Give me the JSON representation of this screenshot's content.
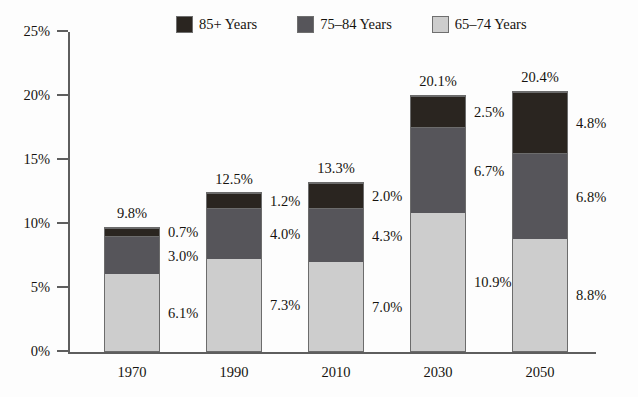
{
  "chart_data": {
    "type": "bar",
    "subtype": "stacked-bar",
    "title": "",
    "xlabel": "",
    "ylabel": "",
    "categories": [
      "1970",
      "1990",
      "2010",
      "2030",
      "2050"
    ],
    "series": [
      {
        "name": "65–74 Years",
        "color": "#cdcdcd",
        "values": [
          6.1,
          7.3,
          7.0,
          10.9,
          8.8
        ],
        "value_labels": [
          "6.1%",
          "7.3%",
          "7.0%",
          "10.9%",
          "8.8%"
        ]
      },
      {
        "name": "75–84 Years",
        "color": "#56555a",
        "values": [
          3.0,
          4.0,
          4.3,
          6.7,
          6.8
        ],
        "value_labels": [
          "3.0%",
          "4.0%",
          "4.3%",
          "6.7%",
          "6.8%"
        ]
      },
      {
        "name": "85+ Years",
        "color": "#2a2520",
        "values": [
          0.7,
          1.2,
          2.0,
          2.5,
          4.8
        ],
        "value_labels": [
          "0.7%",
          "1.2%",
          "2.0%",
          "2.5%",
          "4.8%"
        ]
      }
    ],
    "totals": [
      9.8,
      12.5,
      13.3,
      20.1,
      20.4
    ],
    "total_labels": [
      "9.8%",
      "12.5%",
      "13.3%",
      "20.1%",
      "20.4%"
    ],
    "ylim": [
      0,
      25
    ],
    "yticks": [
      0,
      5,
      10,
      15,
      20,
      25
    ],
    "ytick_labels": [
      "0%",
      "5%",
      "10%",
      "15%",
      "20%",
      "25%"
    ],
    "grid": false,
    "legend_position": "top",
    "stack_order_bottom_to_top": [
      "65–74 Years",
      "75–84 Years",
      "85+ Years"
    ]
  },
  "legend": {
    "entries": [
      {
        "label": "85+ Years",
        "color": "#2a2520"
      },
      {
        "label": "75–84 Years",
        "color": "#56555a"
      },
      {
        "label": "65–74 Years",
        "color": "#cdcdcd"
      }
    ]
  },
  "axis": {
    "ytick_labels": [
      "25%",
      "20%",
      "15%",
      "10%",
      "5%",
      "0%"
    ],
    "xtick_labels": [
      "1970",
      "1990",
      "2010",
      "2030",
      "2050"
    ]
  },
  "colors": {
    "background": "#fdfdfd",
    "axis": "#5e5e5e",
    "bar_outline": "#6c6c6c",
    "text": "#16130f",
    "series_85_plus": "#2a2520",
    "series_75_84": "#56555a",
    "series_65_74": "#cdcdcd"
  }
}
